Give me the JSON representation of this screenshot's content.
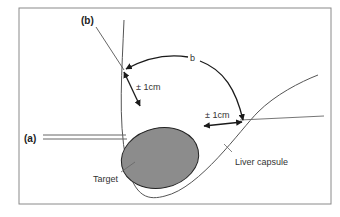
{
  "labels": {
    "probe_a": "(a)",
    "probe_b": "(b)",
    "angle": "b",
    "margin_top": "± 1cm",
    "margin_right": "± 1cm",
    "target": "Target",
    "liver_capsule": "Liver capsule"
  },
  "colors": {
    "frame": "#8a8a8a",
    "target_fill": "#8c8c8c",
    "line": "#555555",
    "arrow": "#1a1a1a"
  }
}
